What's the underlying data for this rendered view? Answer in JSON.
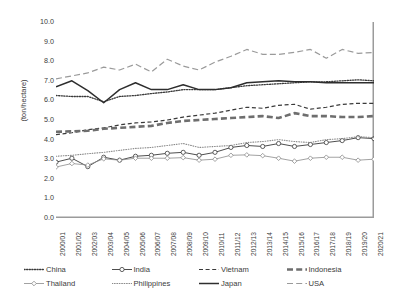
{
  "chart_data": {
    "type": "line",
    "title": "",
    "xlabel": "",
    "ylabel": "(ton/hectare)",
    "ylim": [
      0.0,
      10.0
    ],
    "ytick_step": 1.0,
    "grid": false,
    "legend_position": "bottom",
    "categories": [
      "2000/01",
      "2001/02",
      "2002/03",
      "2003/04",
      "2004/05",
      "2005/06",
      "2006/07",
      "2007/08",
      "2008/09",
      "2009/10",
      "2010/11",
      "2011/12",
      "2012/13",
      "2013/14",
      "2014/15",
      "2015/16",
      "2016/17",
      "2017/18",
      "2018/19",
      "2019/20",
      "2020/21"
    ],
    "ytick_labels": [
      "0.0",
      "1.0",
      "2.0",
      "3.0",
      "4.0",
      "5.0",
      "6.0",
      "7.0",
      "8.0",
      "9.0",
      "10.0"
    ],
    "series": [
      {
        "name": "China",
        "style": "dotted",
        "color": "#3a3a3a",
        "width": 1.3,
        "marker": "none",
        "values": [
          6.25,
          6.2,
          6.2,
          5.93,
          6.2,
          6.25,
          6.35,
          6.43,
          6.55,
          6.55,
          6.55,
          6.65,
          6.75,
          6.8,
          6.85,
          6.9,
          6.95,
          6.95,
          7.0,
          7.05,
          7.0
        ]
      },
      {
        "name": "India",
        "style": "solid",
        "color": "#3a3a3a",
        "width": 0.9,
        "marker": "circle",
        "values": [
          2.85,
          3.05,
          2.62,
          3.1,
          2.95,
          3.15,
          3.2,
          3.3,
          3.35,
          3.2,
          3.35,
          3.6,
          3.7,
          3.65,
          3.8,
          3.65,
          3.75,
          3.85,
          3.95,
          4.1,
          4.05
        ]
      },
      {
        "name": "Vietnam",
        "style": "dashed",
        "color": "#3a3a3a",
        "width": 1.2,
        "marker": "none",
        "values": [
          4.25,
          4.35,
          4.5,
          4.6,
          4.75,
          4.85,
          4.9,
          5.0,
          5.15,
          5.25,
          5.35,
          5.5,
          5.65,
          5.6,
          5.75,
          5.8,
          5.55,
          5.65,
          5.8,
          5.85,
          5.85
        ]
      },
      {
        "name": "Indonesia",
        "style": "long-dash",
        "color": "#6e6e6e",
        "width": 2.6,
        "marker": "none",
        "values": [
          4.4,
          4.42,
          4.45,
          4.55,
          4.6,
          4.65,
          4.7,
          4.85,
          4.95,
          5.0,
          5.05,
          5.1,
          5.15,
          5.2,
          5.1,
          5.35,
          5.2,
          5.2,
          5.15,
          5.15,
          5.2
        ]
      },
      {
        "name": "Thailand",
        "style": "solid",
        "color": "#8a8a8a",
        "width": 0.8,
        "marker": "diamond",
        "values": [
          2.6,
          2.78,
          2.7,
          3.02,
          2.95,
          3.05,
          3.05,
          3.05,
          3.08,
          2.95,
          3.0,
          3.2,
          3.22,
          3.18,
          3.05,
          2.9,
          3.05,
          3.1,
          3.1,
          2.95,
          3.0
        ]
      },
      {
        "name": "Philippines",
        "style": "fine-dotted",
        "color": "#8a8a8a",
        "width": 1.1,
        "marker": "none",
        "values": [
          3.15,
          3.2,
          3.28,
          3.35,
          3.45,
          3.55,
          3.6,
          3.7,
          3.8,
          3.6,
          3.65,
          3.7,
          3.85,
          3.9,
          4.0,
          3.9,
          3.85,
          4.0,
          4.05,
          4.15,
          4.1
        ]
      },
      {
        "name": "Japan",
        "style": "solid",
        "color": "#2e2e2e",
        "width": 1.5,
        "marker": "none",
        "values": [
          6.7,
          7.0,
          6.5,
          5.88,
          6.55,
          6.9,
          6.55,
          6.55,
          6.8,
          6.55,
          6.55,
          6.65,
          6.9,
          6.95,
          7.0,
          6.95,
          6.95,
          6.9,
          6.9,
          6.9,
          6.9
        ]
      },
      {
        "name": "USA",
        "style": "long-dash",
        "color": "#9a9a9a",
        "width": 1.2,
        "marker": "none",
        "values": [
          7.1,
          7.25,
          7.4,
          7.7,
          7.55,
          7.85,
          7.45,
          8.1,
          7.75,
          7.55,
          7.95,
          8.25,
          8.6,
          8.35,
          8.35,
          8.45,
          8.6,
          8.15,
          8.6,
          8.4,
          8.45
        ]
      }
    ]
  },
  "legend": {
    "items": [
      {
        "label": "China",
        "key": "china"
      },
      {
        "label": "India",
        "key": "india"
      },
      {
        "label": "Vietnam",
        "key": "vietnam"
      },
      {
        "label": "Indonesia",
        "key": "indonesia"
      },
      {
        "label": "Thailand",
        "key": "thailand"
      },
      {
        "label": "Philippines",
        "key": "philippines"
      },
      {
        "label": "Japan",
        "key": "japan"
      },
      {
        "label": "USA",
        "key": "usa"
      }
    ]
  }
}
